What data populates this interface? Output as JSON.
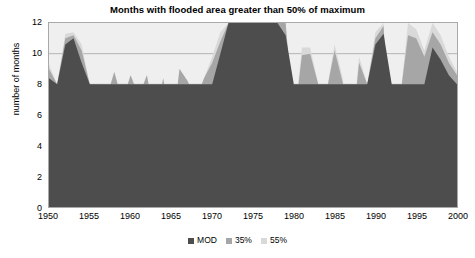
{
  "chart_data": {
    "type": "area",
    "title": "Months with flooded area greater than 50% of maximum",
    "subtitle": "",
    "xlabel": "",
    "ylabel": "number of months",
    "xlim": [
      1950,
      2000
    ],
    "ylim": [
      0,
      12
    ],
    "grid": true,
    "legend_position": "bottom",
    "xticks": [
      "1950",
      "1955",
      "1960",
      "1965",
      "1970",
      "1975",
      "1980",
      "1985",
      "1990",
      "1995",
      "2000"
    ],
    "yticks": [
      "0",
      "2",
      "4",
      "6",
      "8",
      "10",
      "12"
    ],
    "colors": {
      "mod": "#4d4d4d",
      "p35": "#a6a6a6",
      "p55": "#d9d9d9",
      "plot_background": "#efefef",
      "gridline": "#9a9a9a",
      "axis": "#a9a9a9"
    },
    "x": [
      1950,
      1951,
      1952,
      1953,
      1954,
      1955,
      1956,
      1957,
      1958,
      1959,
      1960,
      1961,
      1962,
      1963,
      1964,
      1965,
      1966,
      1967,
      1968,
      1969,
      1970,
      1971,
      1972,
      1973,
      1974,
      1975,
      1976,
      1977,
      1978,
      1979,
      1980,
      1981,
      1982,
      1983,
      1984,
      1985,
      1986,
      1987,
      1988,
      1989,
      1990,
      1991,
      1992,
      1993,
      1994,
      1995,
      1996,
      1997,
      1998,
      1999,
      2000
    ],
    "series": [
      {
        "name": "MOD",
        "color": "#4d4d4d",
        "values": [
          8.4,
          8.0,
          10.6,
          11.0,
          9.4,
          8.0,
          8.0,
          8.0,
          8.0,
          8.0,
          8.0,
          8.0,
          8.0,
          8.0,
          8.0,
          8.0,
          8.0,
          8.0,
          8.0,
          8.0,
          8.0,
          10.0,
          12.0,
          12.0,
          12.0,
          12.0,
          12.0,
          12.0,
          12.0,
          11.2,
          8.0,
          8.0,
          8.0,
          8.0,
          8.0,
          8.0,
          8.0,
          8.0,
          8.0,
          8.0,
          10.6,
          11.3,
          8.0,
          8.0,
          8.0,
          8.0,
          8.0,
          10.4,
          9.6,
          8.6,
          8.0
        ]
      },
      {
        "name": "35%",
        "color": "#a6a6a6",
        "values": [
          9.0,
          8.0,
          11.0,
          11.2,
          10.2,
          8.0,
          8.0,
          7.0,
          8.8,
          6.9,
          8.6,
          7.2,
          8.6,
          5.6,
          8.4,
          4.6,
          9.0,
          8.2,
          7.0,
          8.4,
          9.4,
          10.8,
          12.0,
          12.0,
          12.0,
          12.0,
          12.0,
          12.0,
          12.0,
          12.0,
          5.4,
          9.9,
          10.0,
          8.0,
          7.5,
          10.2,
          8.1,
          4.2,
          9.4,
          8.0,
          11.0,
          11.8,
          2.2,
          7.0,
          11.2,
          11.0,
          9.8,
          11.4,
          10.6,
          9.4,
          8.6
        ]
      },
      {
        "name": "55%",
        "color": "#d9d9d9",
        "values": [
          9.3,
          8.0,
          11.3,
          11.4,
          10.6,
          8.0,
          8.0,
          7.0,
          8.8,
          6.9,
          8.6,
          7.2,
          8.6,
          5.6,
          8.4,
          4.6,
          9.0,
          8.2,
          7.0,
          8.4,
          9.8,
          11.4,
          12.0,
          12.0,
          12.0,
          12.0,
          12.0,
          12.0,
          12.0,
          12.0,
          5.4,
          10.4,
          10.4,
          8.0,
          7.5,
          10.6,
          8.4,
          4.2,
          9.8,
          8.0,
          11.4,
          12.0,
          2.2,
          7.0,
          12.0,
          11.6,
          10.2,
          12.0,
          11.2,
          9.8,
          8.8
        ]
      }
    ]
  },
  "legend": {
    "items": [
      {
        "label": "MOD",
        "color": "#4d4d4d"
      },
      {
        "label": "35%",
        "color": "#a6a6a6"
      },
      {
        "label": "55%",
        "color": "#d9d9d9"
      }
    ]
  }
}
